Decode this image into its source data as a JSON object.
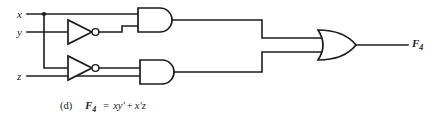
{
  "figure": {
    "kind": "logic-circuit-diagram",
    "width": 439,
    "height": 120,
    "background_color": "#ffffff",
    "ink_color": "#1c1c1c"
  },
  "inputs": [
    {
      "id": "x",
      "label": "x",
      "y": 14
    },
    {
      "id": "y",
      "label": "y",
      "y": 32
    },
    {
      "id": "z",
      "label": "z",
      "y": 76
    }
  ],
  "output": {
    "id": "F4",
    "label_base": "F",
    "label_sub": "4"
  },
  "gates": [
    {
      "id": "inv-y",
      "type": "NOT",
      "label": "inverter",
      "produces": "y'"
    },
    {
      "id": "inv-x",
      "type": "NOT",
      "label": "inverter",
      "produces": "x'"
    },
    {
      "id": "and-top",
      "type": "AND",
      "label": "AND gate",
      "inputs": "x, y'",
      "produces": "xy'"
    },
    {
      "id": "and-bottom",
      "type": "AND",
      "label": "AND gate",
      "inputs": "x', z",
      "produces": "x'z"
    },
    {
      "id": "or-out",
      "type": "OR",
      "label": "OR gate",
      "inputs": "xy', x'z",
      "produces": "F4"
    }
  ],
  "caption": {
    "tag": "(d)",
    "function_name": "F",
    "function_sub": "4",
    "equals": "=",
    "term1": "xy′",
    "plus": "+",
    "term2": "x′z",
    "full_text": "(d)  F₄ = xy′ + x′z"
  }
}
